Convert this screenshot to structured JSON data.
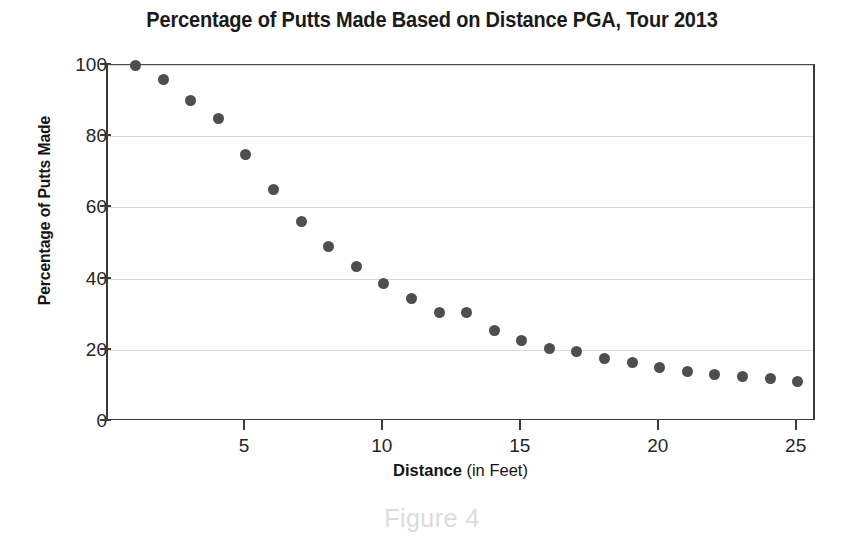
{
  "chart_data": {
    "type": "scatter",
    "title": "Percentage of Putts Made Based on Distance PGA, Tour 2013",
    "xlabel_bold": "Distance",
    "xlabel_rest": " (in Feet)",
    "ylabel": "Percentage of Putts Made",
    "xlim": [
      0,
      25.7
    ],
    "ylim": [
      0,
      100
    ],
    "xticks": [
      5,
      10,
      15,
      20,
      25
    ],
    "yticks": [
      0,
      20,
      40,
      60,
      80,
      100
    ],
    "grid": "horizontal",
    "legend": null,
    "marker_color": "#4e4e4e",
    "x": [
      1,
      2,
      3,
      4,
      5,
      6,
      7,
      8,
      9,
      10,
      11,
      12,
      13,
      14,
      15,
      16,
      17,
      18,
      19,
      20,
      21,
      22,
      23,
      24,
      25
    ],
    "values": [
      100,
      96,
      90,
      85,
      75,
      65,
      56,
      49,
      43.5,
      38.5,
      34.5,
      30.5,
      30.5,
      25.5,
      22.5,
      20.5,
      19.5,
      17.5,
      16.5,
      15,
      14,
      13,
      12.5,
      12,
      11
    ],
    "points": [
      {
        "x": 1,
        "y": 100
      },
      {
        "x": 2,
        "y": 96
      },
      {
        "x": 3,
        "y": 90
      },
      {
        "x": 4,
        "y": 85
      },
      {
        "x": 5,
        "y": 75
      },
      {
        "x": 6,
        "y": 65
      },
      {
        "x": 7,
        "y": 56
      },
      {
        "x": 8,
        "y": 49
      },
      {
        "x": 9,
        "y": 43.5
      },
      {
        "x": 10,
        "y": 38.5
      },
      {
        "x": 11,
        "y": 34.5
      },
      {
        "x": 12,
        "y": 30.5
      },
      {
        "x": 13,
        "y": 30.5
      },
      {
        "x": 14,
        "y": 25.5
      },
      {
        "x": 15,
        "y": 22.5
      },
      {
        "x": 16,
        "y": 20.5
      },
      {
        "x": 17,
        "y": 19.5
      },
      {
        "x": 18,
        "y": 17.5
      },
      {
        "x": 19,
        "y": 16.5
      },
      {
        "x": 20,
        "y": 15
      },
      {
        "x": 21,
        "y": 14
      },
      {
        "x": 22,
        "y": 13
      },
      {
        "x": 23,
        "y": 12.5
      },
      {
        "x": 24,
        "y": 12
      },
      {
        "x": 25,
        "y": 11
      }
    ]
  },
  "caption": "Figure 4"
}
